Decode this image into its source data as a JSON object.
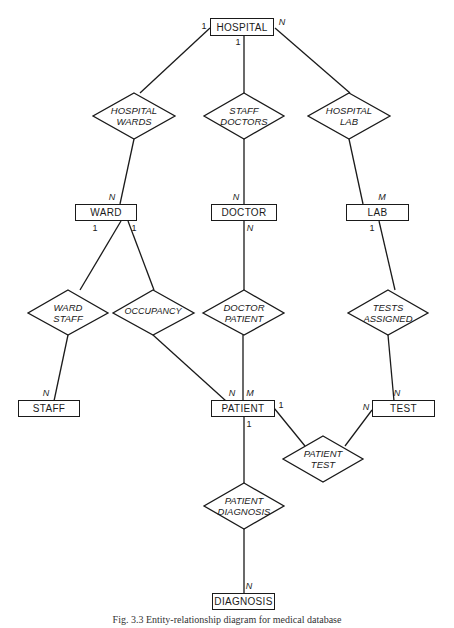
{
  "entities": {
    "hospital": "HOSPITAL",
    "ward": "WARD",
    "doctor": "DOCTOR",
    "lab": "LAB",
    "staff": "STAFF",
    "patient": "PATIENT",
    "test": "TEST",
    "diagnosis": "DIAGNOSIS"
  },
  "relationships": {
    "hospital_wards": "HOSPITAL\nWARDS",
    "staff_doctors": "STAFF\nDOCTORS",
    "hospital_lab": "HOSPITAL\nLAB",
    "ward_staff": "WARD\nSTAFF",
    "occupancy": "OCCUPANCY",
    "doctor_patient": "DOCTOR\nPATIENT",
    "tests_assigned": "TESTS\nASSIGNED",
    "patient_test": "PATIENT\nTEST",
    "patient_diagnosis": "PATIENT\nDIAGNOSIS"
  },
  "cardinalities": {
    "hospital_left": "1",
    "hospital_bottom": "1",
    "hospital_right": "N",
    "ward_top": "N",
    "ward_bottom_left": "1",
    "ward_bottom_right": "1",
    "doctor_top": "N",
    "doctor_bottom": "N",
    "lab_top": "M",
    "lab_bottom": "1",
    "staff_top": "N",
    "patient_top_left": "N",
    "patient_top_right": "M",
    "patient_right": "1",
    "patient_bottom": "1",
    "test_top": "N",
    "test_left": "N",
    "diagnosis_top": "N"
  },
  "caption": "Fig. 3.3 Entity-relationship diagram for medical database"
}
